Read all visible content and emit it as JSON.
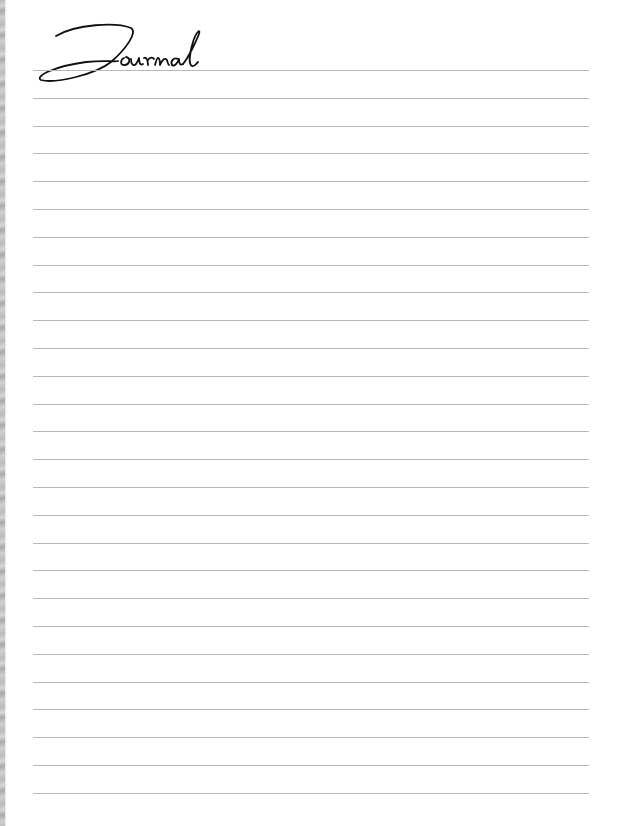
{
  "page": {
    "title": "Journal",
    "line_count": 27,
    "line_color": "#b8b8b8",
    "edge_color": "#bdbdbd"
  }
}
